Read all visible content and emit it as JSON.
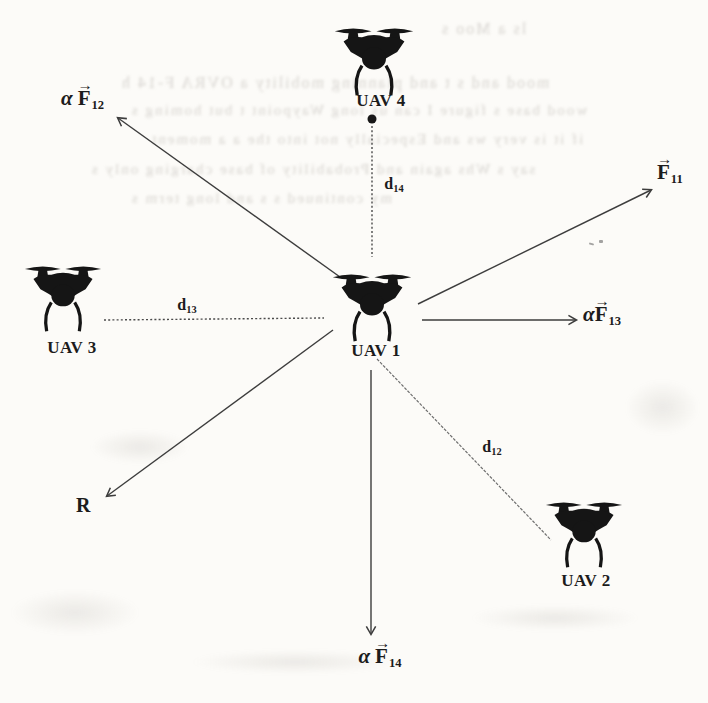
{
  "figure": {
    "uavs": [
      {
        "id": "uav4",
        "label": "UAV 4"
      },
      {
        "id": "uav1",
        "label": "UAV 1"
      },
      {
        "id": "uav3",
        "label": "UAV 3"
      },
      {
        "id": "uav2",
        "label": "UAV 2"
      }
    ],
    "forces": {
      "f12": {
        "alpha": "α",
        "letter": "F",
        "arrow": "→",
        "sub": "12"
      },
      "f11": {
        "alpha": "",
        "letter": "F",
        "arrow": "→",
        "sub": "11"
      },
      "f13": {
        "alpha": "α",
        "letter": "F",
        "arrow": "→",
        "sub": "13"
      },
      "f14": {
        "alpha": "α",
        "letter": "F",
        "arrow": "→",
        "sub": "14"
      }
    },
    "result_label": "R",
    "distances": {
      "d12": {
        "letter": "d",
        "sub": "12"
      },
      "d13": {
        "letter": "d",
        "sub": "13"
      },
      "d14": {
        "letter": "d",
        "sub": "14"
      }
    },
    "colors": {
      "ink": "#1c1c1c",
      "line": "#3d3d3d",
      "dotted_line": "#4a4a4a",
      "paper": "#fcfbf8"
    }
  },
  "ghosts": [
    {
      "text": "ls a Moo s"
    },
    {
      "text": "mood and s t and planning mobility a OVRA F-14 h"
    },
    {
      "text": "wood base s figure I can us long Waypoint t but homing s"
    },
    {
      "text": "if it is very ws and Especially not into the a a moment"
    },
    {
      "text": "say s Whs again and Probability of base charging only s"
    },
    {
      "text": "my continued s s and long term s"
    }
  ]
}
